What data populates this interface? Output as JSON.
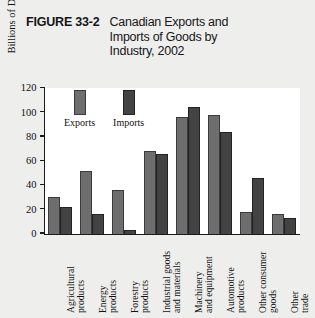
{
  "figure": {
    "number": "FIGURE 33-2",
    "title": "Canadian Exports and Imports of Goods by Industry, 2002"
  },
  "legend": {
    "items": [
      {
        "label": "Exports",
        "color": "#6e6e6e"
      },
      {
        "label": "Imports",
        "color": "#434343"
      }
    ]
  },
  "axis": {
    "y_title": "Billions of Dollars",
    "y_ticks": [
      "0",
      "20",
      "40",
      "60",
      "80",
      "100",
      "120"
    ]
  },
  "chart_data": {
    "type": "bar",
    "title": "Canadian Exports and Imports of Goods by Industry, 2002",
    "xlabel": "",
    "ylabel": "Billions of Dollars",
    "ylim": [
      0,
      120
    ],
    "ytick_step": 20,
    "grid": false,
    "legend_position": "upper-left-inside",
    "categories": [
      "Agricultural products",
      "Energy products",
      "Forestry products",
      "Industrial goods and materials",
      "Machinery and equipment",
      "Automotive products",
      "Other consumer goods",
      "Other trade"
    ],
    "category_lines": [
      [
        "Agricultural",
        "products"
      ],
      [
        "Energy",
        "products"
      ],
      [
        "Forestry",
        "products"
      ],
      [
        "Industrial goods",
        "and materials"
      ],
      [
        "Machinery",
        "and equipment"
      ],
      [
        "Automotive",
        "products"
      ],
      [
        "Other consumer",
        "goods"
      ],
      [
        "Other",
        "trade"
      ]
    ],
    "series": [
      {
        "name": "Exports",
        "color": "#6e6e6e",
        "values": [
          30,
          52,
          36,
          68,
          96,
          98,
          18,
          16
        ]
      },
      {
        "name": "Imports",
        "color": "#434343",
        "values": [
          22,
          16,
          3,
          66,
          104,
          84,
          46,
          13
        ]
      }
    ]
  }
}
